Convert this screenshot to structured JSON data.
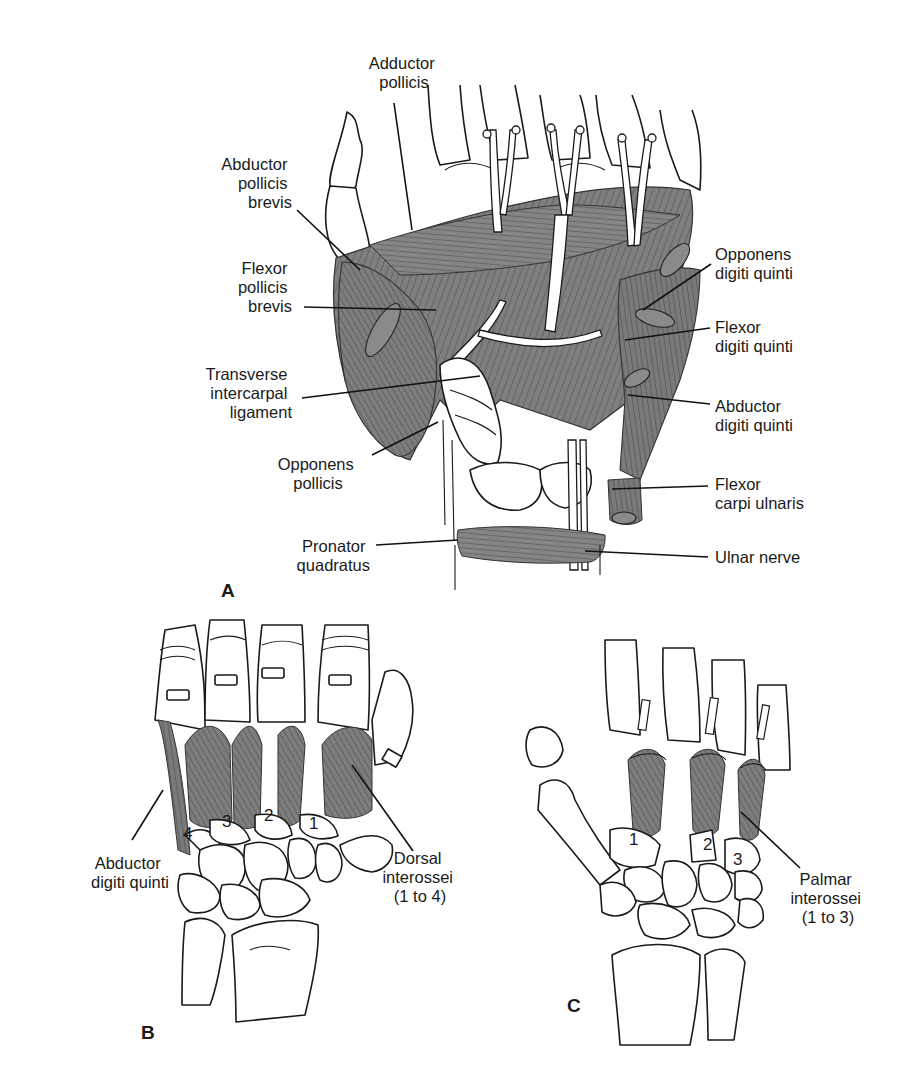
{
  "figure": {
    "panels": [
      {
        "id": "A",
        "letter": "A",
        "labels": [
          {
            "key": "adductor_pollicis",
            "line1": "Adductor",
            "line2": "pollicis",
            "line3": ""
          },
          {
            "key": "abductor_pollicis_brevis",
            "line1": "Abductor",
            "line2": "pollicis",
            "line3": "brevis"
          },
          {
            "key": "flexor_pollicis_brevis",
            "line1": "Flexor",
            "line2": "pollicis",
            "line3": "brevis"
          },
          {
            "key": "transverse_intercarpal_ligament",
            "line1": "Transverse",
            "line2": "intercarpal",
            "line3": "ligament"
          },
          {
            "key": "opponens_pollicis",
            "line1": "Opponens",
            "line2": "pollicis",
            "line3": ""
          },
          {
            "key": "pronator_quadratus",
            "line1": "Pronator",
            "line2": "quadratus",
            "line3": ""
          },
          {
            "key": "opponens_digiti_quinti",
            "line1": "Opponens",
            "line2": "digiti quinti",
            "line3": ""
          },
          {
            "key": "flexor_digiti_quinti",
            "line1": "Flexor",
            "line2": "digiti quinti",
            "line3": ""
          },
          {
            "key": "abductor_digiti_quinti",
            "line1": "Abductor",
            "line2": "digiti quinti",
            "line3": ""
          },
          {
            "key": "flexor_carpi_ulnaris",
            "line1": "Flexor",
            "line2": "carpi ulnaris",
            "line3": ""
          },
          {
            "key": "ulnar_nerve",
            "line1": "Ulnar nerve",
            "line2": "",
            "line3": ""
          }
        ]
      },
      {
        "id": "B",
        "letter": "B",
        "muscle_numbers": [
          "4",
          "3",
          "2",
          "1"
        ],
        "labels": [
          {
            "key": "abductor_digiti_quinti",
            "line1": "Abductor",
            "line2": "digiti quinti",
            "line3": ""
          },
          {
            "key": "dorsal_interossei",
            "line1": "Dorsal",
            "line2": "interossei",
            "line3": "(1 to 4)"
          }
        ]
      },
      {
        "id": "C",
        "letter": "C",
        "muscle_numbers": [
          "1",
          "2",
          "3"
        ],
        "labels": [
          {
            "key": "palmar_interossei",
            "line1": "Palmar",
            "line2": "interossei",
            "line3": "(1 to 3)"
          }
        ]
      }
    ],
    "colors": {
      "muscle": "#7d7d7d",
      "outline": "#1a1a1a",
      "background": "#ffffff"
    }
  }
}
